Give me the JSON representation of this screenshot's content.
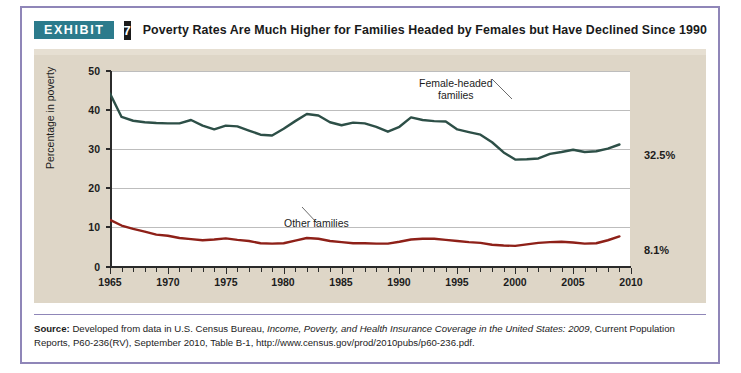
{
  "exhibit": {
    "badge_label": "EXHIBIT",
    "number": "7",
    "title": "Poverty Rates Are Much Higher for Families Headed by Females but Have Declined Since 1990",
    "badge_color": "#2c7b8c",
    "number_color": "#1b1b1b",
    "frame_color": "#8f86b8",
    "panel_color": "#ded6c7"
  },
  "source": {
    "label": "Source:",
    "text_1": " Developed from data in U.S. Census Bureau, ",
    "italic_1": "Income, Poverty, and Health Insurance Coverage in the United States: 2009",
    "text_2": ", Current Population Reports, P60-236(RV), September 2010, Table B-1, http://www.census.gov/prod/2010pubs/p60-236.pdf."
  },
  "chart_data": {
    "type": "line",
    "title": "Poverty Rates Are Much Higher for Families Headed by Females but Have Declined Since 1990",
    "xlabel": "",
    "ylabel": "Percentage in poverty",
    "xlim": [
      1965,
      2010
    ],
    "ylim": [
      0,
      52
    ],
    "grid": true,
    "legend_position": "inline-annotations",
    "yticks": [
      0,
      10,
      20,
      30,
      40,
      50
    ],
    "ytick_labels": [
      "0",
      "10",
      "20",
      "30",
      "40",
      "50"
    ],
    "xticks": [
      1965,
      1970,
      1975,
      1980,
      1985,
      1990,
      1995,
      2000,
      2005,
      2010
    ],
    "xtick_labels": [
      "1965",
      "1970",
      "1975",
      "1980",
      "1985",
      "1990",
      "1995",
      "2000",
      "2005",
      "2010"
    ],
    "x": [
      1965,
      1966,
      1967,
      1968,
      1969,
      1970,
      1971,
      1972,
      1973,
      1974,
      1975,
      1976,
      1977,
      1978,
      1979,
      1980,
      1981,
      1982,
      1983,
      1984,
      1985,
      1986,
      1987,
      1988,
      1989,
      1990,
      1991,
      1992,
      1993,
      1994,
      1995,
      1996,
      1997,
      1998,
      1999,
      2000,
      2001,
      2002,
      2003,
      2004,
      2005,
      2006,
      2007,
      2008,
      2009
    ],
    "series": [
      {
        "name": "Female-headed families",
        "color": "#2d4f47",
        "annotation": "Female-headed\nfamilies",
        "end_label": "32.5%",
        "values": [
          46.0,
          39.8,
          38.8,
          38.4,
          38.2,
          38.1,
          38.1,
          39.0,
          37.5,
          36.5,
          37.5,
          37.3,
          36.2,
          35.1,
          34.9,
          36.7,
          38.7,
          40.6,
          40.2,
          38.4,
          37.6,
          38.3,
          38.1,
          37.2,
          35.9,
          37.2,
          39.7,
          39.0,
          38.7,
          38.6,
          36.5,
          35.8,
          35.1,
          33.1,
          30.4,
          28.5,
          28.6,
          28.8,
          30.0,
          30.5,
          31.1,
          30.5,
          30.7,
          31.4,
          32.5
        ]
      },
      {
        "name": "Other families",
        "color": "#8e2018",
        "annotation": "Other families",
        "end_label": "8.1%",
        "values": [
          12.5,
          11.0,
          10.1,
          9.4,
          8.6,
          8.3,
          7.7,
          7.4,
          7.1,
          7.3,
          7.6,
          7.2,
          6.9,
          6.3,
          6.2,
          6.3,
          7.0,
          7.7,
          7.5,
          6.9,
          6.6,
          6.3,
          6.3,
          6.2,
          6.2,
          6.7,
          7.3,
          7.5,
          7.5,
          7.2,
          6.9,
          6.6,
          6.4,
          5.9,
          5.7,
          5.6,
          6.0,
          6.4,
          6.6,
          6.7,
          6.5,
          6.2,
          6.3,
          7.1,
          8.1
        ]
      }
    ],
    "annotations": [
      {
        "text": "Female-headed families",
        "target_year": 1993
      },
      {
        "text": "Other families",
        "target_year": 1986
      }
    ]
  }
}
